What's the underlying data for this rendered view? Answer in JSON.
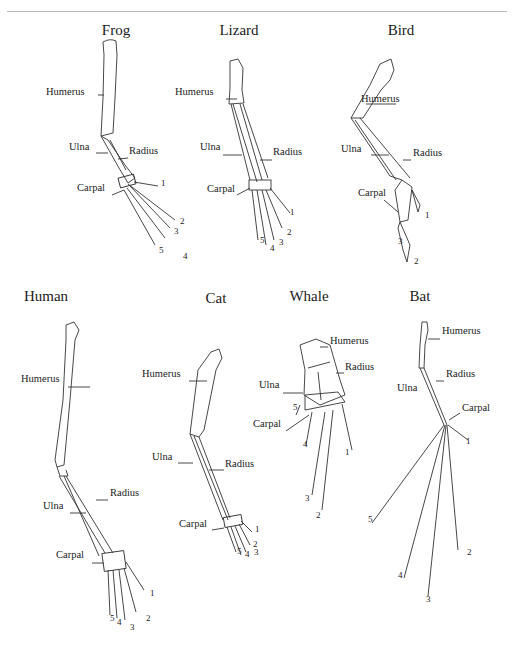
{
  "figure": {
    "animals": [
      {
        "id": "frog",
        "title": "Frog",
        "title_pos": [
          116,
          36
        ],
        "labels": [
          {
            "text": "Humerus",
            "x": 46,
            "y": 95
          },
          {
            "text": "Ulna",
            "x": 69,
            "y": 150
          },
          {
            "text": "Radius",
            "x": 129,
            "y": 154
          },
          {
            "text": "Carpal",
            "x": 77,
            "y": 191
          }
        ],
        "digits": [
          {
            "n": "1",
            "x": 161,
            "y": 186
          },
          {
            "n": "2",
            "x": 180,
            "y": 224
          },
          {
            "n": "3",
            "x": 174,
            "y": 234
          },
          {
            "n": "4",
            "x": 183,
            "y": 259
          },
          {
            "n": "5",
            "x": 159,
            "y": 253
          }
        ]
      },
      {
        "id": "lizard",
        "title": "Lizard",
        "title_pos": [
          239,
          36
        ],
        "labels": [
          {
            "text": "Humerus",
            "x": 175,
            "y": 95
          },
          {
            "text": "Ulna",
            "x": 200,
            "y": 150
          },
          {
            "text": "Radius",
            "x": 273,
            "y": 155
          },
          {
            "text": "Carpal",
            "x": 207,
            "y": 192
          }
        ],
        "digits": [
          {
            "n": "1",
            "x": 290,
            "y": 215
          },
          {
            "n": "2",
            "x": 287,
            "y": 235
          },
          {
            "n": "3",
            "x": 279,
            "y": 245
          },
          {
            "n": "4",
            "x": 270,
            "y": 251
          },
          {
            "n": "5",
            "x": 260,
            "y": 243
          }
        ]
      },
      {
        "id": "bird",
        "title": "Bird",
        "title_pos": [
          401,
          36
        ],
        "labels": [
          {
            "text": "Humerus",
            "x": 361,
            "y": 102
          },
          {
            "text": "Ulna",
            "x": 341,
            "y": 152
          },
          {
            "text": "Radius",
            "x": 413,
            "y": 156
          },
          {
            "text": "Carpal",
            "x": 358,
            "y": 196
          }
        ],
        "digits": [
          {
            "n": "1",
            "x": 425,
            "y": 218
          },
          {
            "n": "3",
            "x": 398,
            "y": 244
          },
          {
            "n": "2",
            "x": 414,
            "y": 264
          }
        ]
      },
      {
        "id": "human",
        "title": "Human",
        "title_pos": [
          46,
          302
        ],
        "labels": [
          {
            "text": "Humerus",
            "x": 21,
            "y": 382
          },
          {
            "text": "Ulna",
            "x": 43,
            "y": 509
          },
          {
            "text": "Radius",
            "x": 110,
            "y": 496
          },
          {
            "text": "Carpal",
            "x": 56,
            "y": 558
          }
        ],
        "digits": [
          {
            "n": "5",
            "x": 110,
            "y": 621
          },
          {
            "n": "4",
            "x": 117,
            "y": 625
          },
          {
            "n": "3",
            "x": 130,
            "y": 630
          },
          {
            "n": "2",
            "x": 146,
            "y": 621
          },
          {
            "n": "1",
            "x": 150,
            "y": 596
          }
        ]
      },
      {
        "id": "cat",
        "title": "Cat",
        "title_pos": [
          216,
          304
        ],
        "labels": [
          {
            "text": "Humerus",
            "x": 142,
            "y": 377
          },
          {
            "text": "Ulna",
            "x": 152,
            "y": 460
          },
          {
            "text": "Radius",
            "x": 225,
            "y": 467
          },
          {
            "text": "Carpal",
            "x": 179,
            "y": 527
          }
        ],
        "digits": [
          {
            "n": "1",
            "x": 255,
            "y": 532
          },
          {
            "n": "2",
            "x": 253,
            "y": 547
          },
          {
            "n": "3",
            "x": 254,
            "y": 555
          },
          {
            "n": "4",
            "x": 245,
            "y": 557
          },
          {
            "n": "5",
            "x": 237,
            "y": 554
          }
        ]
      },
      {
        "id": "whale",
        "title": "Whale",
        "title_pos": [
          309,
          302
        ],
        "labels": [
          {
            "text": "Humerus",
            "x": 330,
            "y": 344
          },
          {
            "text": "Radius",
            "x": 345,
            "y": 370
          },
          {
            "text": "Ulna",
            "x": 259,
            "y": 388
          },
          {
            "text": "Carpal",
            "x": 253,
            "y": 427
          }
        ],
        "digits": [
          {
            "n": "5",
            "x": 293,
            "y": 410
          },
          {
            "n": "4",
            "x": 303,
            "y": 447
          },
          {
            "n": "1",
            "x": 345,
            "y": 455
          },
          {
            "n": "3",
            "x": 305,
            "y": 501
          },
          {
            "n": "2",
            "x": 316,
            "y": 518
          }
        ]
      },
      {
        "id": "bat",
        "title": "Bat",
        "title_pos": [
          420,
          302
        ],
        "labels": [
          {
            "text": "Humerus",
            "x": 442,
            "y": 334
          },
          {
            "text": "Ulna",
            "x": 397,
            "y": 391
          },
          {
            "text": "Radius",
            "x": 446,
            "y": 377
          },
          {
            "text": "Carpal",
            "x": 462,
            "y": 411
          }
        ],
        "digits": [
          {
            "n": "1",
            "x": 466,
            "y": 444
          },
          {
            "n": "5",
            "x": 368,
            "y": 522
          },
          {
            "n": "2",
            "x": 467,
            "y": 555
          },
          {
            "n": "4",
            "x": 398,
            "y": 578
          },
          {
            "n": "3",
            "x": 426,
            "y": 602
          }
        ]
      }
    ],
    "colors": {
      "stroke": "#333333",
      "bg": "#ffffff",
      "rule": "#bbbbbb"
    }
  }
}
